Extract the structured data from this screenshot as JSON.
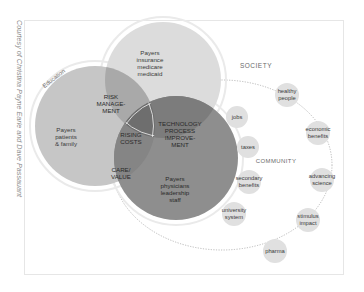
{
  "credit": "Courtesy of Christina Payne Earle and Dave Passauant",
  "labels": {
    "society": "SOCIETY",
    "community": "COMMUNITY",
    "education": "Education"
  },
  "circles": {
    "insurance": [
      "Payers",
      "insurance",
      "medicare",
      "medicaid"
    ],
    "patients": [
      "Payers",
      "patients",
      "& family"
    ],
    "physicians": [
      "Payers",
      "physicians",
      "leadership",
      "staff"
    ]
  },
  "overlaps": {
    "risk_management": [
      "RISK",
      "MANAGE-",
      "MENT"
    ],
    "technology": [
      "TECHNOLOGY",
      "PROCESS",
      "IMPROVE-",
      "MENT"
    ],
    "rising_costs": [
      "RISING",
      "COSTS"
    ],
    "care_value": [
      "CARE/",
      "VALUE"
    ]
  },
  "bubbles": [
    {
      "lines": [
        "healthy",
        "people"
      ]
    },
    {
      "lines": [
        "jobs"
      ]
    },
    {
      "lines": [
        "economic",
        "benefits"
      ]
    },
    {
      "lines": [
        "taxes"
      ]
    },
    {
      "lines": [
        "advancing",
        "science"
      ]
    },
    {
      "lines": [
        "secondary",
        "benefits"
      ]
    },
    {
      "lines": [
        "university",
        "system"
      ]
    },
    {
      "lines": [
        "stimulus",
        "impact"
      ]
    },
    {
      "lines": [
        "pharma"
      ]
    }
  ],
  "colors": {
    "insurance_fill": "#dcdcdc",
    "patients_fill": "#c4c4c4",
    "physicians_fill": "#8e8e8e",
    "overlap_dark": "#7a7a7a",
    "bubble_fill": "#e0e0e0",
    "ring": "#ffffff"
  }
}
